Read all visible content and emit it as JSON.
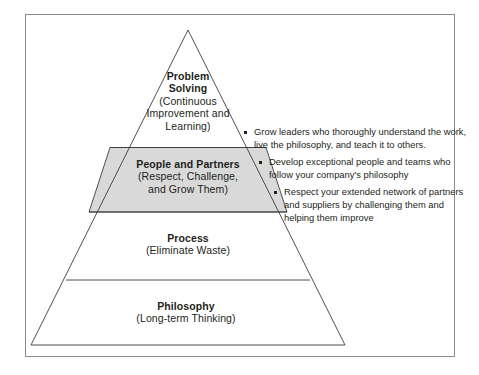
{
  "figure": {
    "type": "pyramid-diagram",
    "border_color": "#8a8a8a",
    "background": "#ffffff",
    "outline_color": "#3c3c3c",
    "highlight_fill": "#d9d9d9"
  },
  "pyramid": {
    "tiers": [
      {
        "id": "problem-solving",
        "title": "Problem Solving",
        "title_lines": [
          "Problem",
          "Solving"
        ],
        "subtitle": "(Continuous Improvement and Learning)",
        "subtitle_lines": [
          "(Continuous",
          "Improvement and",
          "Learning)"
        ],
        "shaded": false
      },
      {
        "id": "people-and-partners",
        "title": "People and Partners",
        "title_lines": [
          "People and Partners"
        ],
        "subtitle": "(Respect, Challenge, and Grow Them)",
        "subtitle_lines": [
          "(Respect, Challenge,",
          "and Grow Them)"
        ],
        "shaded": true
      },
      {
        "id": "process",
        "title": "Process",
        "title_lines": [
          "Process"
        ],
        "subtitle": "(Eliminate Waste)",
        "subtitle_lines": [
          "(Eliminate Waste)"
        ],
        "shaded": false
      },
      {
        "id": "philosophy",
        "title": "Philosophy",
        "title_lines": [
          "Philosophy"
        ],
        "subtitle": "(Long-term Thinking)",
        "subtitle_lines": [
          "(Long-term Thinking)"
        ],
        "shaded": false
      }
    ]
  },
  "annotations": {
    "bullets": [
      {
        "marker": "square-bullet",
        "text": "Grow leaders who thoroughly understand the work, live the philosophy, and teach it to others."
      },
      {
        "marker": "square-bullet",
        "text": "Develop exceptional people and teams who follow your company's philosophy"
      },
      {
        "marker": "square-bullet",
        "text": "Respect your extended network of partners and suppliers by challenging them and helping them improve"
      }
    ]
  }
}
